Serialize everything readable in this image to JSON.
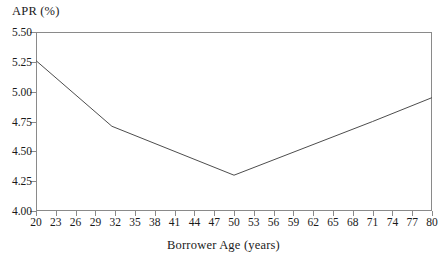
{
  "chart_data": {
    "type": "line",
    "title": "",
    "xlabel": "Borrower Age (years)",
    "ylabel": "APR (%)",
    "xlim": [
      20,
      80
    ],
    "ylim": [
      4.0,
      5.5
    ],
    "xticks": [
      20,
      23,
      26,
      29,
      32,
      35,
      38,
      41,
      44,
      47,
      50,
      53,
      56,
      59,
      62,
      65,
      68,
      71,
      74,
      77,
      80
    ],
    "ytick_labels": [
      "5.50",
      "5.25",
      "5.00",
      "4.75",
      "4.50",
      "4.25",
      "4.00"
    ],
    "yticks": [
      5.5,
      5.25,
      5.0,
      4.75,
      4.5,
      4.25,
      4.0
    ],
    "grid": false,
    "legend": "none",
    "line_color": "#4d4d4d",
    "axis_color": "#8a8a8a",
    "background": "#ffffff",
    "series": [
      {
        "name": "APR by borrower age",
        "x": [
          20,
          31.5,
          50,
          71,
          80
        ],
        "values": [
          5.26,
          4.71,
          4.3,
          4.75,
          4.95
        ]
      }
    ],
    "annotations": {
      "minimum_age": 50,
      "minimum_apr": 4.3,
      "start_apr": 5.26,
      "end_apr": 4.95
    }
  },
  "axes": {
    "y_title": "APR (%)",
    "x_title": "Borrower Age (years)"
  }
}
